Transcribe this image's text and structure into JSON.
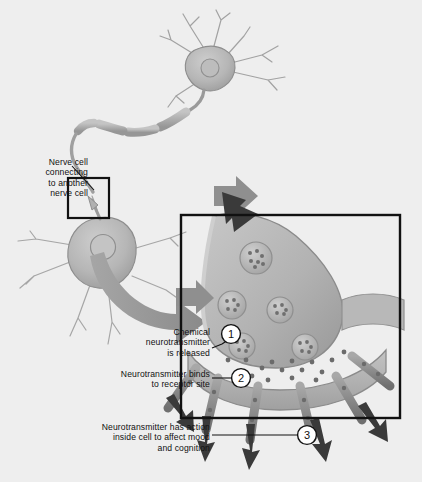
{
  "figure": {
    "background_color": "#eeeeee",
    "ink_color": "#111111",
    "cell_fill": "#b4b4b4",
    "cell_stroke": "#8d8d8d",
    "arrow_dark": "#3a3a3a",
    "arrow_gray": "#9a9a9a",
    "box_stroke": "#111111"
  },
  "labels": {
    "nerve_cell": "Nerve cell\nconnecting\nto another\nnerve cell",
    "step1": "Chemical\nneurotransmitter\nis released",
    "step2": "Neurotransmitter binds\nto receptor site",
    "step3": "Neurotransmitter has action\ninside cell to affect mood\nand cognition"
  },
  "markers": [
    {
      "id": "marker-1",
      "number": "1"
    },
    {
      "id": "marker-2",
      "number": "2"
    },
    {
      "id": "marker-3",
      "number": "3"
    }
  ],
  "parts": {
    "upper_neuron": "upper neuron soma with dendrites and myelinated axon",
    "lower_neuron": "lower neuron soma with nucleus and dendrites",
    "inset_box": "magnification inset on synaptic contact",
    "detail_box": "magnified synapse panel",
    "terminal": "presynaptic axon terminal",
    "vesicles": "synaptic vesicles containing neurotransmitter",
    "cleft_particles": "neurotransmitter molecules in synaptic cleft",
    "receptors": "postsynaptic receptor arms",
    "sweep_arrow": "magnification sweep arrow",
    "impulse_arrow": "nerve impulse arrow into terminal",
    "effect_arrows": "signal arrows into postsynaptic cell"
  }
}
